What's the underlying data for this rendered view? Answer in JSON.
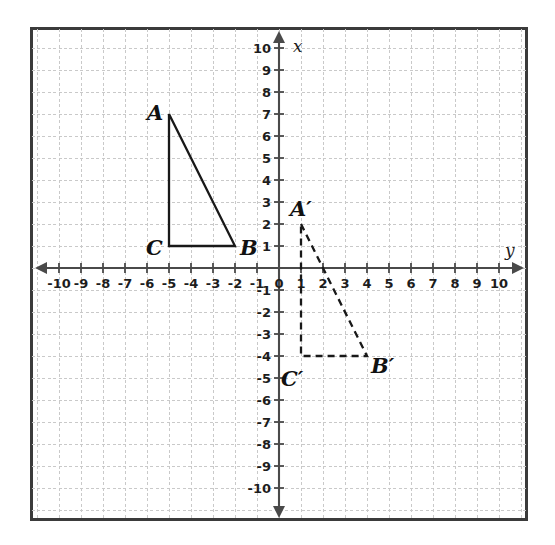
{
  "figure": {
    "axis_labels": {
      "x": "x",
      "y": "y"
    },
    "colors": {
      "grid": "#c9c9c9",
      "axis": "#4a4a4a",
      "border": "#3b3b3b",
      "shape_stroke": "#181818",
      "label_text": "#111111",
      "background": "#ffffff"
    }
  },
  "chart_data": {
    "type": "scatter",
    "xlabel": "x",
    "ylabel": "y",
    "xlim": [
      -10,
      10
    ],
    "ylim": [
      -10,
      10
    ],
    "grid": true,
    "legend": "none",
    "x_tick_labels": [
      "-10",
      "-9",
      "-8",
      "-7",
      "-6",
      "-5",
      "-4",
      "-3",
      "-2",
      "-1",
      "0",
      "1",
      "2",
      "3",
      "4",
      "5",
      "6",
      "7",
      "8",
      "9",
      "10"
    ],
    "y_tick_labels": [
      "10",
      "9",
      "8",
      "7",
      "6",
      "5",
      "4",
      "3",
      "2",
      "1",
      "-1",
      "-2",
      "-3",
      "-4",
      "-5",
      "-6",
      "-7",
      "-8",
      "-9",
      "-10"
    ],
    "origin_label": "0",
    "series": [
      {
        "name": "Triangle ABC",
        "style": "solid",
        "closed": true,
        "points": [
          {
            "label": "A",
            "x": -5,
            "y": 7,
            "label_pos": "upper-left"
          },
          {
            "label": "B",
            "x": -2,
            "y": 1,
            "label_pos": "right"
          },
          {
            "label": "C",
            "x": -5,
            "y": 1,
            "label_pos": "left"
          }
        ]
      },
      {
        "name": "Triangle A'B'C'",
        "style": "dashed",
        "closed": true,
        "points": [
          {
            "label": "A′",
            "x": 1,
            "y": 2,
            "label_pos": "upper-left"
          },
          {
            "label": "B′",
            "x": 4,
            "y": -4,
            "label_pos": "lower-right"
          },
          {
            "label": "C′",
            "x": 1,
            "y": -4,
            "label_pos": "lower-left"
          }
        ]
      }
    ]
  },
  "vertex_labels": {
    "a": "A",
    "b": "B",
    "c": "C",
    "a_prime": "A′",
    "b_prime": "B′",
    "c_prime": "C′"
  },
  "x_axis": {
    "name": "x",
    "ticks": [
      {
        "value": -10,
        "label": "-10"
      },
      {
        "value": -9,
        "label": "-9"
      },
      {
        "value": -8,
        "label": "-8"
      },
      {
        "value": -7,
        "label": "-7"
      },
      {
        "value": -6,
        "label": "-6"
      },
      {
        "value": -5,
        "label": "-5"
      },
      {
        "value": -4,
        "label": "-4"
      },
      {
        "value": -3,
        "label": "-3"
      },
      {
        "value": -2,
        "label": "-2"
      },
      {
        "value": -1,
        "label": "-1"
      },
      {
        "value": 0,
        "label": "0"
      },
      {
        "value": 1,
        "label": "1"
      },
      {
        "value": 2,
        "label": "2"
      },
      {
        "value": 3,
        "label": "3"
      },
      {
        "value": 4,
        "label": "4"
      },
      {
        "value": 5,
        "label": "5"
      },
      {
        "value": 6,
        "label": "6"
      },
      {
        "value": 7,
        "label": "7"
      },
      {
        "value": 8,
        "label": "8"
      },
      {
        "value": 9,
        "label": "9"
      },
      {
        "value": 10,
        "label": "10"
      }
    ]
  },
  "y_axis": {
    "name": "y",
    "ticks": [
      {
        "value": 10,
        "label": "10"
      },
      {
        "value": 9,
        "label": "9"
      },
      {
        "value": 8,
        "label": "8"
      },
      {
        "value": 7,
        "label": "7"
      },
      {
        "value": 6,
        "label": "6"
      },
      {
        "value": 5,
        "label": "5"
      },
      {
        "value": 4,
        "label": "4"
      },
      {
        "value": 3,
        "label": "3"
      },
      {
        "value": 2,
        "label": "2"
      },
      {
        "value": 1,
        "label": "1"
      },
      {
        "value": -1,
        "label": "-1"
      },
      {
        "value": -2,
        "label": "-2"
      },
      {
        "value": -3,
        "label": "-3"
      },
      {
        "value": -4,
        "label": "-4"
      },
      {
        "value": -5,
        "label": "-5"
      },
      {
        "value": -6,
        "label": "-6"
      },
      {
        "value": -7,
        "label": "-7"
      },
      {
        "value": -8,
        "label": "-8"
      },
      {
        "value": -9,
        "label": "-9"
      },
      {
        "value": -10,
        "label": "-10"
      }
    ]
  }
}
